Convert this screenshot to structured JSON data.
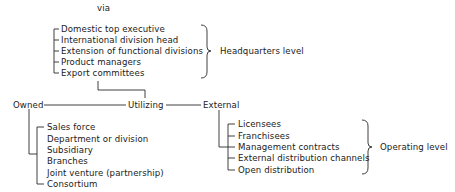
{
  "header": {
    "via": "via"
  },
  "headquarters": {
    "items": [
      "Domestic top executive",
      "International division head",
      "Extension of functional divisions",
      "Product managers",
      "Export committees"
    ],
    "level_label": "Headquarters level"
  },
  "main_axis": {
    "owned": "Owned",
    "utilizing": "Utilizing",
    "external": "External"
  },
  "owned": {
    "items": [
      "Sales force",
      "Department or division",
      "Subsidiary",
      "Branches",
      "Joint venture (partnership)",
      "Consortium"
    ]
  },
  "external": {
    "items": [
      "Licensees",
      "Franchisees",
      "Management contracts",
      "External distribution channels",
      "Open distribution"
    ],
    "level_label": "Operating level"
  }
}
